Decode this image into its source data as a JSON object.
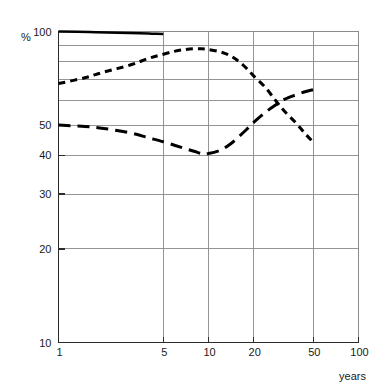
{
  "chart_data": {
    "type": "line",
    "title": "",
    "subtitle": "",
    "xlabel": "years",
    "ylabel": "%",
    "xscale": "log",
    "yscale": "log",
    "xlim": [
      1,
      100
    ],
    "ylim": [
      10,
      100
    ],
    "grid": true,
    "legend": "none",
    "x_ticks": [
      {
        "value": 1,
        "label": "1"
      },
      {
        "value": 5,
        "label": "5"
      },
      {
        "value": 10,
        "label": "10"
      },
      {
        "value": 20,
        "label": "20"
      },
      {
        "value": 50,
        "label": "50"
      },
      {
        "value": 100,
        "label": "100"
      }
    ],
    "y_ticks": [
      {
        "value": 100,
        "label": "100"
      },
      {
        "value": 90,
        "label": ""
      },
      {
        "value": 80,
        "label": ""
      },
      {
        "value": 70,
        "label": ""
      },
      {
        "value": 60,
        "label": ""
      },
      {
        "value": 50,
        "label": "50"
      },
      {
        "value": 40,
        "label": "40"
      },
      {
        "value": 30,
        "label": "30"
      },
      {
        "value": 20,
        "label": "20"
      },
      {
        "value": 10,
        "label": "10"
      }
    ],
    "series": [
      {
        "name": "solid-curve",
        "style": "solid",
        "dash": "none",
        "color": "#000000",
        "width": 2.6,
        "x": [
          1,
          1.6,
          2.5,
          3.5,
          4.2,
          5
        ],
        "y": [
          100,
          99.6,
          99.1,
          98.7,
          98.4,
          98.2
        ]
      },
      {
        "name": "dotted-curve",
        "style": "short-dash",
        "dash": "7,5",
        "color": "#000000",
        "width": 3.0,
        "x": [
          1,
          1.5,
          2,
          3,
          4,
          5,
          6,
          7,
          8,
          9,
          10,
          12,
          14,
          16,
          18,
          20,
          24,
          28,
          32,
          38,
          44,
          50
        ],
        "y": [
          68,
          71,
          74,
          78,
          82,
          84.5,
          86.5,
          87.5,
          88,
          88,
          87.5,
          86,
          83.5,
          80,
          76,
          72,
          66,
          60,
          55.5,
          51,
          47,
          44
        ]
      },
      {
        "name": "dashed-curve",
        "style": "long-dash",
        "dash": "12,7",
        "color": "#000000",
        "width": 3.0,
        "x": [
          1,
          1.5,
          2,
          3,
          4,
          5,
          6,
          7,
          8,
          9,
          10,
          12,
          14,
          16,
          18,
          20,
          24,
          28,
          32,
          38,
          44,
          50
        ],
        "y": [
          50,
          49.5,
          48.8,
          47.2,
          45.5,
          44.2,
          43,
          42,
          41.2,
          40.5,
          40.5,
          41.5,
          43.5,
          46,
          48.5,
          51,
          55,
          58,
          60.5,
          62.5,
          64,
          65
        ]
      }
    ]
  },
  "axis_labels": {
    "y_axis_title": "%",
    "x_axis_title": "years"
  }
}
